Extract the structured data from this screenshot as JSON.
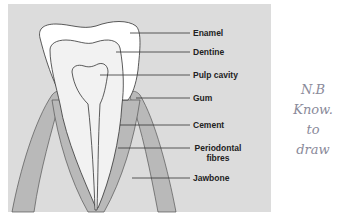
{
  "diagram": {
    "colors": {
      "panel": "#dcdcdc",
      "enamel": "#ffffff",
      "dentine": "#f2f2f2",
      "pulp": "#f2f2f2",
      "gum_bone": "#b9b9b9",
      "outline": "#333333"
    },
    "labels": [
      {
        "id": "enamel",
        "text": "Enamel"
      },
      {
        "id": "dentine",
        "text": "Dentine"
      },
      {
        "id": "pulp",
        "text": "Pulp cavity"
      },
      {
        "id": "gum",
        "text": "Gum"
      },
      {
        "id": "cement",
        "text": "Cement"
      },
      {
        "id": "periodontal",
        "text": "Periodontal fibres"
      },
      {
        "id": "jawbone",
        "text": "Jawbone"
      }
    ]
  },
  "handwritten_note": {
    "lines": [
      "N.B",
      "Know.",
      "to",
      "draw"
    ]
  }
}
